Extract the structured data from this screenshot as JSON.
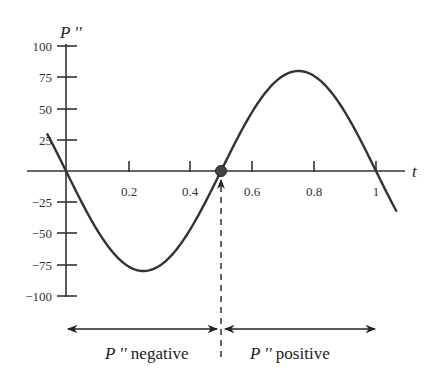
{
  "chart_data": {
    "type": "line",
    "title": "",
    "xlabel": "t",
    "ylabel": "P ''",
    "xlim": [
      0,
      1.1
    ],
    "ylim": [
      -100,
      100
    ],
    "x_ticks": [
      0.2,
      0.4,
      0.6,
      0.8,
      1
    ],
    "x_tick_labels": [
      "0.2",
      "0.4",
      "0.6",
      "0.8",
      "1"
    ],
    "y_ticks": [
      100,
      75,
      50,
      25,
      -25,
      -50,
      -75,
      -100
    ],
    "y_tick_labels": [
      "100",
      "75",
      "50",
      "25",
      "−25",
      "−50",
      "−75",
      "−100"
    ],
    "grid": false,
    "legend": null,
    "series": [
      {
        "name": "P''(t)",
        "formula": "-80*sin(2*pi*t)",
        "x": [
          -0.05,
          0,
          0.125,
          0.25,
          0.375,
          0.5,
          0.625,
          0.75,
          0.875,
          1,
          1.05
        ],
        "y": [
          24.7,
          0,
          -56.6,
          -80,
          -56.6,
          0,
          56.6,
          80,
          56.6,
          0,
          -24.7
        ]
      }
    ],
    "annotations": [
      {
        "type": "point",
        "x": 0.5,
        "y": 0,
        "label": "inflection point"
      },
      {
        "type": "dashed-vertical-arrow",
        "x": 0.5,
        "from_y": -100,
        "to_y": 0
      },
      {
        "type": "double-arrow",
        "from_x": 0,
        "to_x": 0.5,
        "label": "P'' negative"
      },
      {
        "type": "double-arrow",
        "from_x": 0.5,
        "to_x": 1.0,
        "label": "P'' positive"
      }
    ]
  },
  "labels": {
    "y_axis_title": "P ''",
    "x_axis_title": "t",
    "region_negative_symbol": "P ''",
    "region_negative_text": " negative",
    "region_positive_symbol": "P ''",
    "region_positive_text": " positive"
  },
  "ticks": {
    "x": [
      "0.2",
      "0.4",
      "0.6",
      "0.8",
      "1"
    ],
    "y": [
      "100",
      "75",
      "50",
      "25",
      "−25",
      "−50",
      "−75",
      "−100"
    ]
  },
  "colors": {
    "curve": "#333333",
    "axis": "#333333",
    "point": "#444444"
  }
}
